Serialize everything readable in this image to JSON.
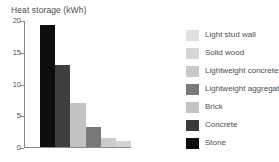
{
  "chart_data": {
    "type": "bar",
    "title": "Heat storage (kWh)",
    "xlabel": "",
    "ylabel": "",
    "ylim": [
      0,
      20
    ],
    "yticks": [
      0,
      5,
      10,
      15,
      20
    ],
    "ytick_labels": [
      "0",
      "5",
      "10",
      "15",
      "20"
    ],
    "grid": false,
    "legend_position": "right",
    "categories": [
      "Light stud wall",
      "Stone",
      "Concrete",
      "Brick",
      "Lightweight aggregate",
      "Lightweight concrete",
      "Solid wood"
    ],
    "bars": [
      {
        "name": "Light stud wall",
        "value": 0.0,
        "color": "#e8e8e8"
      },
      {
        "name": "Stone",
        "value": 19.3,
        "color": "#0d0d0d"
      },
      {
        "name": "Concrete",
        "value": 13.0,
        "color": "#3f3f3f"
      },
      {
        "name": "Brick",
        "value": 7.0,
        "color": "#c2c2c2"
      },
      {
        "name": "Lightweight aggregate",
        "value": 3.1,
        "color": "#787878"
      },
      {
        "name": "Lightweight concrete",
        "value": 1.5,
        "color": "#cccccc"
      },
      {
        "name": "Solid wood",
        "value": 1.0,
        "color": "#d4d4d4"
      }
    ],
    "legend": [
      {
        "label": "Light stud wall",
        "color": "#e0e0e0"
      },
      {
        "label": "Solid wood",
        "color": "#d6d6d6"
      },
      {
        "label": "Lightweight concrete",
        "color": "#c9c9c9"
      },
      {
        "label": "Lightweight aggregate",
        "color": "#7a7a7a"
      },
      {
        "label": "Brick",
        "color": "#c2c2c2"
      },
      {
        "label": "Concrete",
        "color": "#3a3a3a"
      },
      {
        "label": "Stone",
        "color": "#0d0d0d"
      }
    ]
  }
}
